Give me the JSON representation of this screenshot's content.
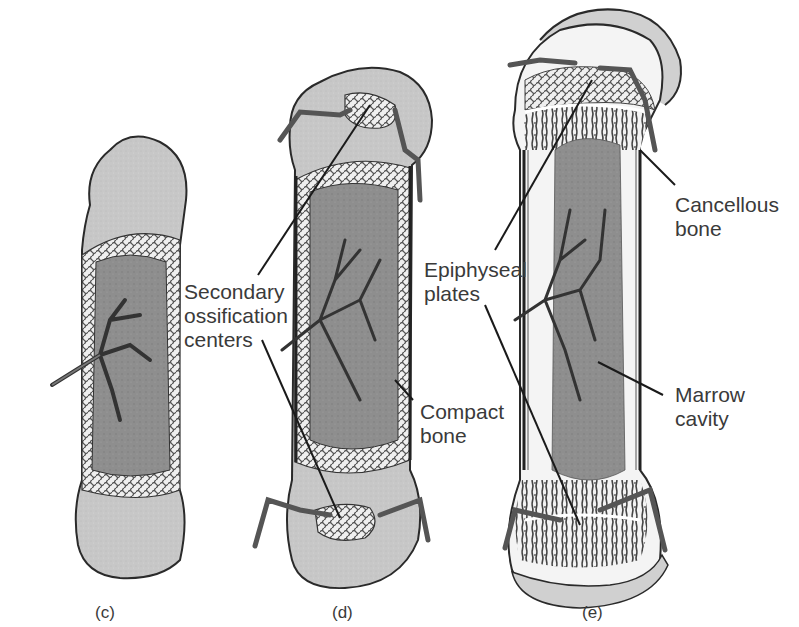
{
  "figure": {
    "panels": [
      {
        "id": "c",
        "label": "(c)"
      },
      {
        "id": "d",
        "label": "(d)"
      },
      {
        "id": "e",
        "label": "(e)"
      }
    ],
    "labels": {
      "secondary_ossification": "Secondary\nossification\ncenters",
      "compact_bone": "Compact\nbone",
      "epiphyseal_plates": "Epiphyseal\nplates",
      "cancellous_bone": "Cancellous\nbone",
      "marrow_cavity": "Marrow\ncavity"
    },
    "colors": {
      "cartilage": "#c9c9c9",
      "marrow": "#8a8a8a",
      "spongy": "#e8e8e8",
      "vessel": "#555555",
      "outline": "#2a2a2a",
      "text": "#3a3a3a"
    }
  }
}
